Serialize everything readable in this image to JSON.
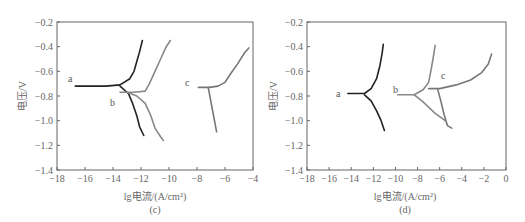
{
  "chart_data": [
    {
      "panel": "(c)",
      "type": "line",
      "xlabel": "lg电流/(A/cm²)",
      "ylabel": "电压/V",
      "xlim": [
        -18,
        -4
      ],
      "ylim": [
        -1.4,
        -0.2
      ],
      "xticks": [
        "-18",
        "-16",
        "-14",
        "-12",
        "-10",
        "-8",
        "-6",
        "-4"
      ],
      "yticks": [
        "-0.2",
        "-0.4",
        "-0.6",
        "-0.8",
        "-1.0",
        "-1.2",
        "-1.4"
      ],
      "grid": false,
      "series": [
        {
          "name": "a",
          "color": "#222222",
          "anodic": [
            [
              -16.7,
              -0.72
            ],
            [
              -14.5,
              -0.72
            ],
            [
              -13.5,
              -0.71
            ],
            [
              -12.8,
              -0.66
            ],
            [
              -12.5,
              -0.6
            ],
            [
              -12.3,
              -0.52
            ],
            [
              -12.1,
              -0.44
            ],
            [
              -11.9,
              -0.35
            ]
          ],
          "cathodic": [
            [
              -13.5,
              -0.72
            ],
            [
              -12.9,
              -0.78
            ],
            [
              -12.6,
              -0.86
            ],
            [
              -12.3,
              -0.96
            ],
            [
              -12.1,
              -1.05
            ],
            [
              -11.8,
              -1.12
            ]
          ]
        },
        {
          "name": "b",
          "color": "#888888",
          "anodic": [
            [
              -13.5,
              -0.77
            ],
            [
              -12.5,
              -0.77
            ],
            [
              -11.7,
              -0.76
            ],
            [
              -11.4,
              -0.7
            ],
            [
              -11.0,
              -0.6
            ],
            [
              -10.6,
              -0.5
            ],
            [
              -10.2,
              -0.4
            ],
            [
              -9.9,
              -0.35
            ]
          ],
          "cathodic": [
            [
              -13.0,
              -0.77
            ],
            [
              -12.3,
              -0.8
            ],
            [
              -11.7,
              -0.86
            ],
            [
              -11.3,
              -0.96
            ],
            [
              -11.0,
              -1.06
            ],
            [
              -10.6,
              -1.13
            ],
            [
              -10.4,
              -1.16
            ]
          ]
        },
        {
          "name": "c",
          "color": "#777777",
          "anodic": [
            [
              -7.9,
              -0.73
            ],
            [
              -7.1,
              -0.73
            ],
            [
              -6.5,
              -0.72
            ],
            [
              -6.0,
              -0.69
            ],
            [
              -5.6,
              -0.62
            ],
            [
              -5.1,
              -0.54
            ],
            [
              -4.6,
              -0.45
            ],
            [
              -4.3,
              -0.41
            ]
          ],
          "cathodic": [
            [
              -7.2,
              -0.73
            ],
            [
              -7.0,
              -0.85
            ],
            [
              -6.8,
              -0.97
            ],
            [
              -6.6,
              -1.09
            ]
          ]
        }
      ]
    },
    {
      "panel": "(d)",
      "type": "line",
      "xlabel": "lg电流/(A/cm²)",
      "ylabel": "电压/V",
      "xlim": [
        -18,
        0
      ],
      "ylim": [
        -1.4,
        -0.2
      ],
      "xticks": [
        "-18",
        "-16",
        "-14",
        "-12",
        "-10",
        "-8",
        "-6",
        "-4",
        "-2",
        "0"
      ],
      "yticks": [
        "-0.2",
        "-0.4",
        "-0.6",
        "-0.8",
        "-1.0",
        "-1.2",
        "-1.4"
      ],
      "grid": false,
      "series": [
        {
          "name": "a",
          "color": "#222222",
          "anodic": [
            [
              -14.3,
              -0.78
            ],
            [
              -12.8,
              -0.78
            ],
            [
              -12.2,
              -0.74
            ],
            [
              -11.7,
              -0.66
            ],
            [
              -11.4,
              -0.55
            ],
            [
              -11.2,
              -0.45
            ],
            [
              -11.1,
              -0.38
            ]
          ],
          "cathodic": [
            [
              -12.8,
              -0.79
            ],
            [
              -12.2,
              -0.84
            ],
            [
              -11.7,
              -0.92
            ],
            [
              -11.3,
              -1.0
            ],
            [
              -11.0,
              -1.08
            ]
          ]
        },
        {
          "name": "b",
          "color": "#888888",
          "anodic": [
            [
              -9.8,
              -0.79
            ],
            [
              -8.3,
              -0.79
            ],
            [
              -7.5,
              -0.75
            ],
            [
              -7.0,
              -0.69
            ],
            [
              -6.8,
              -0.6
            ],
            [
              -6.6,
              -0.5
            ],
            [
              -6.4,
              -0.39
            ]
          ],
          "cathodic": [
            [
              -8.3,
              -0.79
            ],
            [
              -7.6,
              -0.84
            ],
            [
              -7.0,
              -0.89
            ],
            [
              -6.4,
              -0.94
            ],
            [
              -5.8,
              -0.98
            ],
            [
              -5.5,
              -1.0
            ]
          ]
        },
        {
          "name": "c",
          "color": "#777777",
          "anodic": [
            [
              -7.0,
              -0.74
            ],
            [
              -6.0,
              -0.74
            ],
            [
              -4.5,
              -0.71
            ],
            [
              -3.2,
              -0.67
            ],
            [
              -2.2,
              -0.61
            ],
            [
              -1.6,
              -0.54
            ],
            [
              -1.3,
              -0.46
            ]
          ],
          "cathodic": [
            [
              -6.2,
              -0.74
            ],
            [
              -5.9,
              -0.84
            ],
            [
              -5.6,
              -0.95
            ],
            [
              -5.3,
              -1.04
            ],
            [
              -4.9,
              -1.06
            ]
          ]
        }
      ]
    }
  ],
  "panels": [
    {
      "caption": "(c)",
      "xlabel": "lg电流/(A/cm²)",
      "ylabel": "电压/V",
      "xticks": [
        "−18",
        "−16",
        "−14",
        "−12",
        "−10",
        "−8",
        "−6",
        "−4"
      ],
      "yticks": [
        "−0.2",
        "−0.4",
        "−0.6",
        "−0.8",
        "−1.0",
        "−1.2",
        "−1.4"
      ],
      "curve_labels": [
        "a",
        "b",
        "c"
      ]
    },
    {
      "caption": "(d)",
      "xlabel": "lg电流/(A/cm²)",
      "ylabel": "电压/V",
      "xticks": [
        "−18",
        "−16",
        "−14",
        "−12",
        "−10",
        "−8",
        "−6",
        "−4",
        "−2",
        "0"
      ],
      "yticks": [
        "−0.2",
        "−0.4",
        "−0.6",
        "−0.8",
        "−1.0",
        "−1.2",
        "−1.4"
      ],
      "curve_labels": [
        "a",
        "b",
        "c"
      ]
    }
  ]
}
